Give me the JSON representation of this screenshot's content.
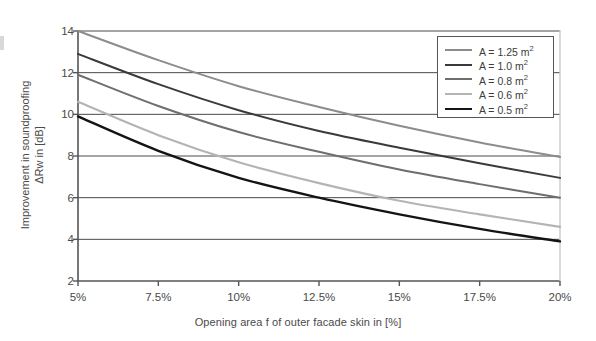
{
  "chart_data": {
    "type": "line",
    "title": "",
    "xlabel": "Opening area f of outer facade skin in [%]",
    "ylabel_line1": "Improvement in soundproofing",
    "ylabel_line2": "ΔRᴡ in [dB]",
    "x": [
      5,
      7.5,
      10,
      12.5,
      15,
      17.5,
      20
    ],
    "xtick_labels": [
      "5%",
      "7.5%",
      "10%",
      "12.5%",
      "15%",
      "17.5%",
      "20%"
    ],
    "ytick_labels": [
      "2",
      "4",
      "6",
      "8",
      "10",
      "12",
      "14"
    ],
    "ytick_values": [
      2,
      4,
      6,
      8,
      10,
      12,
      14
    ],
    "xlim": [
      5,
      20
    ],
    "ylim": [
      2,
      14
    ],
    "grid": "horizontal",
    "legend_position": "top-right",
    "series": [
      {
        "name": "A = 1.25 m²",
        "label_prefix": "A = 1.25 m",
        "label_sup": "2",
        "color": "#8c8c8c",
        "width": 2.0,
        "values": [
          14.0,
          12.6,
          11.35,
          10.35,
          9.45,
          8.65,
          7.95
        ]
      },
      {
        "name": "A = 1.0 m²",
        "label_prefix": "A = 1.0 m",
        "label_sup": "2",
        "color": "#3a3a3a",
        "width": 2.0,
        "values": [
          12.9,
          11.45,
          10.2,
          9.2,
          8.4,
          7.65,
          6.95
        ]
      },
      {
        "name": "A = 0.8 m²",
        "label_prefix": "A = 0.8 m",
        "label_sup": "2",
        "color": "#6e6e6e",
        "width": 2.0,
        "values": [
          11.9,
          10.4,
          9.15,
          8.2,
          7.35,
          6.65,
          6.0
        ]
      },
      {
        "name": "A = 0.6 m²",
        "label_prefix": "A = 0.6 m",
        "label_sup": "2",
        "color": "#b4b4b4",
        "width": 2.2,
        "values": [
          10.6,
          9.0,
          7.7,
          6.7,
          5.85,
          5.2,
          4.6
        ]
      },
      {
        "name": "A = 0.5 m²",
        "label_prefix": "A = 0.5 m",
        "label_sup": "2",
        "color": "#141414",
        "width": 2.4,
        "values": [
          9.9,
          8.25,
          6.95,
          6.0,
          5.2,
          4.5,
          3.9
        ]
      }
    ],
    "axis_color": "#555555",
    "grid_color": "#4a4a4a",
    "background": "#ffffff"
  }
}
